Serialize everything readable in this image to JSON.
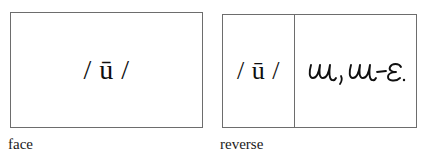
{
  "figure": {
    "background_color": "#ffffff",
    "border_color": "#6d6d6d",
    "ink_color": "#101010"
  },
  "cards": [
    {
      "id": "face",
      "caption": "face",
      "cells": [
        {
          "id": "face-main",
          "kind": "printed",
          "text": "/ ū /"
        }
      ]
    },
    {
      "id": "reverse",
      "caption": "reverse",
      "cells": [
        {
          "id": "reverse-headword",
          "kind": "printed",
          "text": "/ ū /"
        },
        {
          "id": "reverse-gloss",
          "kind": "handwritten",
          "text": "u, u-ε",
          "icon": "handwritten-script"
        }
      ]
    }
  ]
}
